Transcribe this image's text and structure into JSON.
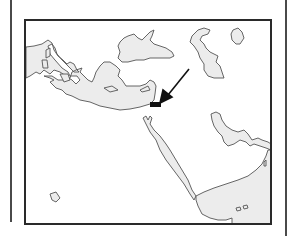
{
  "figure": {
    "type": "outline-map",
    "region": "Mediterranean and Middle East",
    "background_color": "#ffffff",
    "water_fill_color": "#ececec",
    "outline_color": "#555555",
    "frame_color": "#2a2a2a",
    "marker": {
      "shape": "filled-rectangle",
      "color": "#111111",
      "location_description": "eastern Mediterranean coast (Levant)"
    },
    "arrow": {
      "color": "#111111",
      "direction": "pointing down-left toward marker"
    },
    "water_bodies": [
      "mediterranean-sea",
      "black-sea",
      "caspian-sea",
      "lake-urmia",
      "red-sea",
      "persian-gulf",
      "arabian-sea-gulf-of-aden"
    ],
    "labels": []
  }
}
